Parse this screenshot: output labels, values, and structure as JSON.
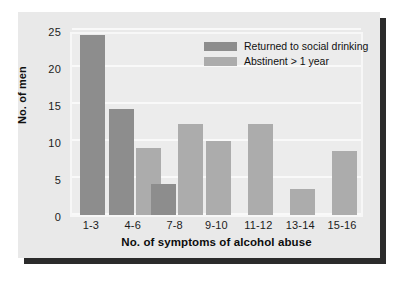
{
  "chart_data": {
    "type": "bar",
    "title": "",
    "xlabel": "No. of symptoms of alcohol abuse",
    "ylabel": "No. of men",
    "categories": [
      "1-3",
      "4-6",
      "7-8",
      "9-10",
      "11-12",
      "13-14",
      "15-16"
    ],
    "ylim": [
      0,
      25
    ],
    "yticks": [
      0,
      5,
      10,
      15,
      20,
      25
    ],
    "grid": true,
    "legend_position": "top-right",
    "series": [
      {
        "name": "Returned to social drinking",
        "color": "#8d8d8d",
        "values": [
          24.3,
          14.3,
          4.2,
          null,
          null,
          null,
          null
        ]
      },
      {
        "name": "Abstinent > 1 year",
        "color": "#acacac",
        "values": [
          null,
          9.0,
          12.3,
          10.0,
          12.3,
          3.5,
          8.7
        ]
      }
    ],
    "bars": [
      {
        "category": "1-3",
        "series": "Returned to social drinking",
        "value": 24.3
      },
      {
        "category": "4-6",
        "series": "Returned to social drinking",
        "value": 14.3
      },
      {
        "category": "4-6",
        "series": "Abstinent > 1 year",
        "value": 9.0
      },
      {
        "category": "7-8",
        "series": "Returned to social drinking",
        "value": 4.2
      },
      {
        "category": "7-8",
        "series": "Abstinent > 1 year",
        "value": 12.3
      },
      {
        "category": "9-10",
        "series": "Abstinent > 1 year",
        "value": 10.0
      },
      {
        "category": "11-12",
        "series": "Abstinent > 1 year",
        "value": 12.3
      },
      {
        "category": "13-14",
        "series": "Abstinent > 1 year",
        "value": 3.5
      },
      {
        "category": "15-16",
        "series": "Abstinent > 1 year",
        "value": 8.7
      }
    ]
  },
  "style": {
    "page_background": "#ffffff",
    "card_background": "#e9e9e9",
    "plot_background": "#ececec",
    "gridline_color": "#f9f9f9",
    "shadow_color": "#2b2b2b",
    "text_color": "#1c1c1c"
  }
}
